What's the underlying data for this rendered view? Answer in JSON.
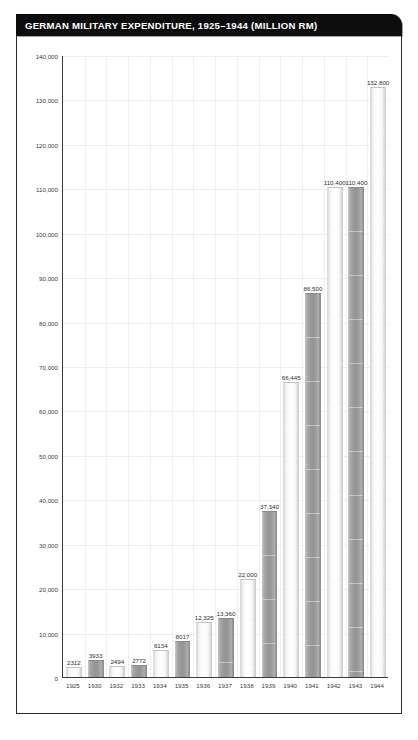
{
  "figure": {
    "title": "GERMAN MILITARY EXPENDITURE, 1925–1944 (MILLION RM)",
    "title_bg": "#0d0d0d",
    "title_fg": "#ffffff",
    "frame_color": "#2b2b2b",
    "axis_color": "#3a3a3a",
    "grid_color": "#ededed",
    "bar_light_color": "#fbfbfb",
    "bar_dark_color": "#9b9b9b"
  },
  "chart_data": {
    "type": "bar",
    "title": "GERMAN MILITARY EXPENDITURE, 1925–1944 (MILLION RM)",
    "xlabel": "",
    "ylabel": "",
    "unit": "million RM",
    "grid": true,
    "legend": "none",
    "ylim": [
      0,
      140000
    ],
    "ytick_step": 10000,
    "ytick_labels": [
      "0",
      "10,000",
      "20,000",
      "30,000",
      "40,000",
      "50,000",
      "60,000",
      "70,000",
      "80,000",
      "90,000",
      "100,000",
      "110,000",
      "120,000",
      "130,000",
      "140,000"
    ],
    "ytick_values": [
      0,
      10000,
      20000,
      30000,
      40000,
      50000,
      60000,
      70000,
      80000,
      90000,
      100000,
      110000,
      120000,
      130000,
      140000
    ],
    "categories": [
      "1925",
      "1930",
      "1932",
      "1933",
      "1934",
      "1935",
      "1936",
      "1937",
      "1938",
      "1939",
      "1940",
      "1941",
      "1942",
      "1943",
      "1944"
    ],
    "values": [
      2312,
      3933,
      2494,
      2772,
      6134,
      8017,
      12325,
      13360,
      22000,
      37340,
      66445,
      86500,
      110400,
      110400,
      132800
    ],
    "data_labels": [
      "2312",
      "3933",
      "2494",
      "2772",
      "6134",
      "8017",
      "12,325",
      "13,360",
      "22,000",
      "37,340",
      "66,445",
      "86,500",
      "110,400",
      "110,400",
      "132,800"
    ],
    "bar_styles": [
      "light",
      "dark",
      "light",
      "dark",
      "light",
      "dark",
      "light",
      "dark",
      "light",
      "dark",
      "light",
      "dark",
      "light",
      "dark",
      "light"
    ]
  }
}
